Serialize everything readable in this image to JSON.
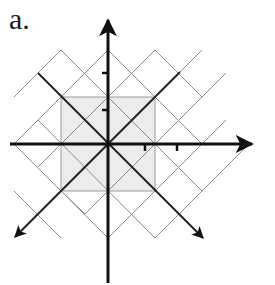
{
  "figure": {
    "label": "a.",
    "origin": [
      108,
      144
    ],
    "unit": 47,
    "colors": {
      "axis": "#111111",
      "grid": "#8a8a8a",
      "square_fill": "#ececec",
      "square_stroke": "#9a9a9a"
    },
    "axes": [
      {
        "name": "x-axis",
        "direction": "horizontal",
        "arrow": "right"
      },
      {
        "name": "y-axis",
        "direction": "vertical",
        "arrow": "up"
      }
    ],
    "diagonal_axes": [
      {
        "name": "diagonal-axis-ne-sw",
        "arrow": "bottom-left"
      },
      {
        "name": "diagonal-axis-nw-se",
        "arrow": "bottom-right"
      }
    ],
    "ticks": {
      "x": [
        1,
        2
      ],
      "y": [
        1,
        2
      ]
    },
    "shaded_square": {
      "half_side_units": 1
    },
    "diagonal_grid_offsets": [
      -2,
      -1,
      0,
      1,
      2
    ]
  }
}
